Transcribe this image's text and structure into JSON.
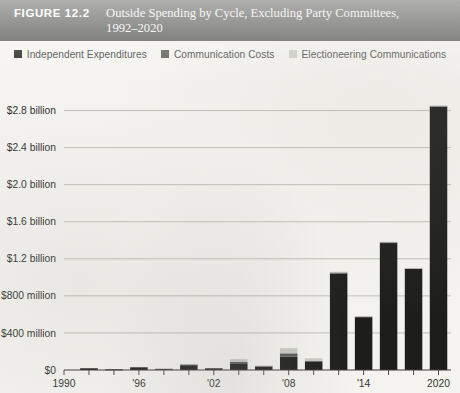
{
  "figure": {
    "label": "FIGURE 12.2",
    "title_line1": "Outside Spending by Cycle, Excluding Party Committees,",
    "title_line2": "1992–2020",
    "title_bar_color": "#4e4e4c"
  },
  "legend": {
    "position": "top-center",
    "items": [
      {
        "label": "Independent Expenditures",
        "color": "#1d1d1b"
      },
      {
        "label": "Communication Costs",
        "color": "#55554f"
      },
      {
        "label": "Electioneering Communications",
        "color": "#c9c9c4"
      }
    ]
  },
  "chart_data": {
    "type": "bar",
    "stacked": true,
    "title": "Outside Spending by Cycle, Excluding Party Committees, 1992–2020",
    "xlabel": "",
    "ylabel": "",
    "grid": true,
    "legend_position": "top-center",
    "ylim": [
      0,
      3000000000
    ],
    "ytick_values": [
      0,
      400000000,
      800000000,
      1200000000,
      1600000000,
      2000000000,
      2400000000,
      2800000000
    ],
    "ytick_labels": [
      "$0",
      "$400 million",
      "$800 million",
      "$1.2 billion",
      "$1.6 billion",
      "$2.0 billion",
      "$2.4 billion",
      "$2.8 billion"
    ],
    "xtick_labels": [
      "1990",
      "'96",
      "'02",
      "'08",
      "'14",
      "2020"
    ],
    "xtick_years": [
      1990,
      1996,
      2002,
      2008,
      2014,
      2020
    ],
    "categories": [
      1992,
      1994,
      1996,
      1998,
      2000,
      2002,
      2004,
      2006,
      2008,
      2010,
      2012,
      2014,
      2016,
      2018,
      2020
    ],
    "units": "USD",
    "series": [
      {
        "name": "Independent Expenditures",
        "color": "#1d1d1b",
        "values": [
          18000000,
          6000000,
          27000000,
          11000000,
          52000000,
          17000000,
          65000000,
          38000000,
          145000000,
          90000000,
          1040000000,
          570000000,
          1370000000,
          1090000000,
          2840000000
        ]
      },
      {
        "name": "Communication Costs",
        "color": "#55554f",
        "values": [
          2000000,
          1000000,
          4000000,
          2000000,
          7000000,
          3000000,
          22000000,
          6000000,
          35000000,
          8000000,
          12000000,
          8000000,
          10000000,
          8000000,
          10000000
        ]
      },
      {
        "name": "Electioneering Communications",
        "color": "#c9c9c4",
        "values": [
          0,
          0,
          0,
          0,
          0,
          0,
          30000000,
          4000000,
          55000000,
          28000000,
          8000000,
          4000000,
          4000000,
          3000000,
          3000000
        ]
      }
    ]
  }
}
